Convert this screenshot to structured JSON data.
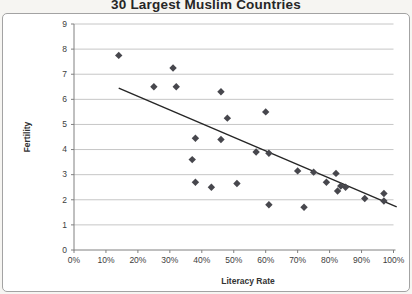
{
  "title": "30 Largest Muslim Countries",
  "chart_data": {
    "type": "scatter",
    "title": "30 Largest Muslim Countries",
    "xlabel": "Literacy Rate",
    "ylabel": "Fertility",
    "xlim": [
      0,
      1
    ],
    "ylim": [
      0,
      9
    ],
    "x_tick_labels": [
      "0%",
      "10%",
      "20%",
      "30%",
      "40%",
      "50%",
      "60%",
      "70%",
      "80%",
      "90%",
      "100%"
    ],
    "x_tick_values": [
      0,
      0.1,
      0.2,
      0.3,
      0.4,
      0.5,
      0.6,
      0.7,
      0.8,
      0.9,
      1.0
    ],
    "y_tick_labels": [
      "0",
      "1",
      "2",
      "3",
      "4",
      "5",
      "6",
      "7",
      "8",
      "9"
    ],
    "y_tick_values": [
      0,
      1,
      2,
      3,
      4,
      5,
      6,
      7,
      8,
      9
    ],
    "grid": "horizontal-only",
    "legend": "none",
    "marker": "diamond",
    "points": [
      [
        0.14,
        7.75
      ],
      [
        0.31,
        7.25
      ],
      [
        0.25,
        6.5
      ],
      [
        0.32,
        6.5
      ],
      [
        0.46,
        6.3
      ],
      [
        0.48,
        5.25
      ],
      [
        0.6,
        5.5
      ],
      [
        0.38,
        4.45
      ],
      [
        0.46,
        4.4
      ],
      [
        0.37,
        3.6
      ],
      [
        0.57,
        3.9
      ],
      [
        0.61,
        3.85
      ],
      [
        0.7,
        3.15
      ],
      [
        0.75,
        3.1
      ],
      [
        0.82,
        3.05
      ],
      [
        0.79,
        2.7
      ],
      [
        0.38,
        2.7
      ],
      [
        0.43,
        2.5
      ],
      [
        0.51,
        2.65
      ],
      [
        0.835,
        2.55
      ],
      [
        0.85,
        2.5
      ],
      [
        0.825,
        2.35
      ],
      [
        0.91,
        2.05
      ],
      [
        0.97,
        2.25
      ],
      [
        0.97,
        1.95
      ],
      [
        0.61,
        1.8
      ],
      [
        0.72,
        1.7
      ]
    ],
    "trendline": {
      "x_start": 0.14,
      "y_start": 6.45,
      "x_end": 1.01,
      "y_end": 1.72
    },
    "colors": {
      "marker": "#47474d",
      "trendline": "#262626",
      "gridline": "#c6c6c6",
      "axis": "#808080",
      "tick_text": "#3d3d3d",
      "axis_label_text": "#333333",
      "title_text": "#262626",
      "plot_background": "#ffffff"
    }
  }
}
